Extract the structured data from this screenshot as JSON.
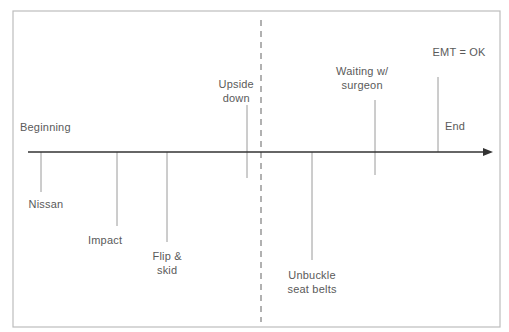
{
  "diagram": {
    "type": "timeline",
    "frame": {
      "x": 13,
      "y": 11,
      "width": 487,
      "height": 316,
      "stroke": "#bdbdbd"
    },
    "axis": {
      "y": 152,
      "x_start": 28,
      "x_end": 493,
      "color": "#333333"
    },
    "divider": {
      "x": 261,
      "y_start": 20,
      "y_end": 322,
      "style": "dashed",
      "color": "#888888"
    },
    "colors": {
      "tick": "#9a9a9a",
      "text": "#5a5a5a"
    },
    "events": [
      {
        "id": "beginning",
        "label_lines": [
          "Beginning"
        ],
        "tick": null,
        "label_x": 20,
        "label_y": 120,
        "align": "left"
      },
      {
        "id": "nissan",
        "label_lines": [
          "Nissan"
        ],
        "tick": {
          "x": 41,
          "y1": 152,
          "y2": 192
        },
        "label_x": 46,
        "label_y": 197,
        "align": "center"
      },
      {
        "id": "impact",
        "label_lines": [
          "Impact"
        ],
        "tick": {
          "x": 117,
          "y1": 152,
          "y2": 226
        },
        "label_x": 105,
        "label_y": 233,
        "align": "center"
      },
      {
        "id": "flip-skid",
        "label_lines": [
          "Flip &",
          "skid"
        ],
        "tick": {
          "x": 167,
          "y1": 152,
          "y2": 242
        },
        "label_x": 167,
        "label_y": 249,
        "align": "center"
      },
      {
        "id": "upside-down",
        "label_lines": [
          "Upside",
          "down"
        ],
        "tick": {
          "x": 247,
          "y1": 105,
          "y2": 178
        },
        "label_x": 236,
        "label_y": 77,
        "align": "center"
      },
      {
        "id": "unbuckle",
        "label_lines": [
          "Unbuckle",
          "seat belts"
        ],
        "tick": {
          "x": 312,
          "y1": 152,
          "y2": 260
        },
        "label_x": 312,
        "label_y": 268,
        "align": "center"
      },
      {
        "id": "waiting",
        "label_lines": [
          "Waiting w/",
          "surgeon"
        ],
        "tick": {
          "x": 375,
          "y1": 100,
          "y2": 175
        },
        "label_x": 362,
        "label_y": 64,
        "align": "center"
      },
      {
        "id": "emt-ok",
        "label_lines": [
          "EMT = OK"
        ],
        "tick": {
          "x": 438,
          "y1": 77,
          "y2": 152
        },
        "label_x": 459,
        "label_y": 45,
        "align": "center"
      },
      {
        "id": "end",
        "label_lines": [
          "End"
        ],
        "tick": null,
        "label_x": 445,
        "label_y": 119,
        "align": "left"
      }
    ]
  }
}
